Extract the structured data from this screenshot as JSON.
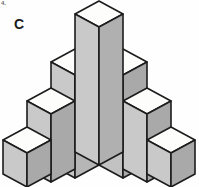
{
  "figure": {
    "label": "C",
    "corner_mark": "4.",
    "type": "isometric-block-stack",
    "projection": {
      "cube_width_half": 24,
      "cube_rise": 13,
      "cube_height": 34,
      "origin_x": 99.5,
      "origin_y": 154
    },
    "colors": {
      "top_face": "#fdfdfb",
      "left_face": "#c9c9c9",
      "right_face": "#a9a9a9",
      "center_left_face": "#c2c2c2",
      "center_right_face": "#b4b4b4",
      "outline": "#1c1c1c",
      "background": "#fefefe",
      "label": "#1a1a1a"
    },
    "columns": [
      {
        "name": "far-left",
        "side": "left",
        "offset": 2,
        "height_cubes": 1
      },
      {
        "name": "mid-left",
        "side": "left",
        "offset": 1,
        "height_cubes": 2
      },
      {
        "name": "inner-left",
        "side": "left",
        "offset": 0.5,
        "height_cubes": 3
      },
      {
        "name": "center",
        "side": "center",
        "offset": 0,
        "height_cubes": 4
      },
      {
        "name": "inner-right",
        "side": "right",
        "offset": 0.5,
        "height_cubes": 3
      },
      {
        "name": "mid-right",
        "side": "right",
        "offset": 1,
        "height_cubes": 2
      },
      {
        "name": "far-right",
        "side": "right",
        "offset": 2,
        "height_cubes": 1
      }
    ]
  }
}
